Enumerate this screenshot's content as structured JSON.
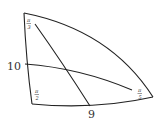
{
  "diagram": {
    "type": "curved triangle (non-Euclidean / hyperbolic)",
    "vertices": {
      "top": {
        "angle_label": "π/3",
        "num": "π",
        "den": "3"
      },
      "bottom_left": {
        "angle_label": "π/2",
        "num": "π",
        "den": "2"
      },
      "right": {
        "angle_label": "π/5",
        "num": "π",
        "den": "5"
      }
    },
    "sides": {
      "left": {
        "label": "10"
      },
      "bottom": {
        "label": "9"
      }
    },
    "colors": {
      "stroke": "#222222",
      "text": "#333333",
      "background": "#ffffff"
    }
  }
}
